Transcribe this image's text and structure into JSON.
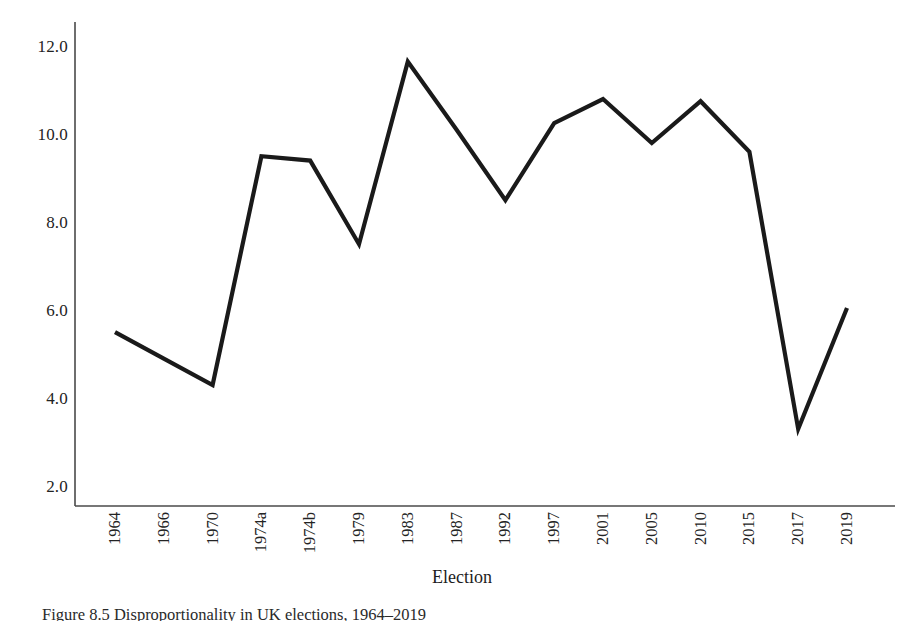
{
  "figure": {
    "caption": "Figure 8.5  Disproportionality in UK elections, 1964–2019"
  },
  "chart_data": {
    "type": "line",
    "title": "",
    "xlabel": "Election",
    "ylabel": "",
    "categories": [
      "1964",
      "1966",
      "1970",
      "1974a",
      "1974b",
      "1979",
      "1983",
      "1987",
      "1992",
      "1997",
      "2001",
      "2005",
      "2010",
      "2015",
      "2017",
      "2019"
    ],
    "values": [
      5.5,
      4.9,
      4.3,
      9.5,
      9.4,
      7.5,
      11.65,
      10.1,
      8.5,
      10.25,
      10.8,
      9.8,
      10.75,
      9.6,
      3.3,
      6.05
    ],
    "series": [
      {
        "name": "Disproportionality index",
        "values": [
          5.5,
          4.9,
          4.3,
          9.5,
          9.4,
          7.5,
          11.65,
          10.1,
          8.5,
          10.25,
          10.8,
          9.8,
          10.75,
          9.6,
          3.3,
          6.05
        ]
      }
    ],
    "yticks": [
      "2.0",
      "4.0",
      "6.0",
      "8.0",
      "10.0",
      "12.0"
    ],
    "ytick_values": [
      2.0,
      4.0,
      6.0,
      8.0,
      10.0,
      12.0
    ],
    "ylim": [
      1.55,
      12.55
    ],
    "grid": false,
    "legend": false,
    "line_color": "#1a1a1a",
    "axis_color": "#4a4a4a",
    "background": "#ffffff"
  }
}
